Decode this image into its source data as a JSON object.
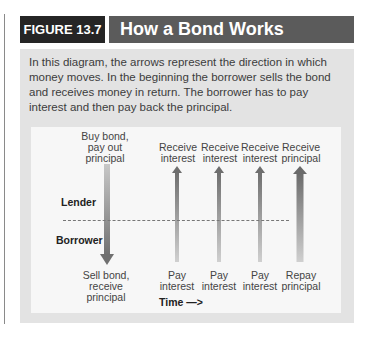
{
  "figure": {
    "tag": "FIGURE 13.7",
    "title": "How a Bond Works",
    "intro": "In this diagram, the arrows represent the direction in which money moves. In the beginning the borrower sells the bond and receives money in return. The borrower has to pay interest and then pay back the principal."
  },
  "diagram": {
    "roles": {
      "top": "Lender",
      "bottom": "Borrower"
    },
    "time_label": "Time —>",
    "columns": [
      {
        "top_label": [
          "Buy bond,",
          "pay out",
          "principal"
        ],
        "bottom_label": [
          "Sell bond,",
          "receive",
          "principal"
        ],
        "direction": "down",
        "width": "wide"
      },
      {
        "top_label": [
          "Receive",
          "interest"
        ],
        "bottom_label": [
          "Pay",
          "interest"
        ],
        "direction": "up",
        "width": "narrow"
      },
      {
        "top_label": [
          "Receive",
          "interest"
        ],
        "bottom_label": [
          "Pay",
          "interest"
        ],
        "direction": "up",
        "width": "narrow"
      },
      {
        "top_label": [
          "Receive",
          "interest"
        ],
        "bottom_label": [
          "Pay",
          "interest"
        ],
        "direction": "up",
        "width": "narrow"
      },
      {
        "top_label": [
          "Receive",
          "principal"
        ],
        "bottom_label": [
          "Repay",
          "principal"
        ],
        "direction": "up",
        "width": "wide"
      }
    ]
  },
  "colors": {
    "tag_bg": "#252525",
    "title_bg": "#5b5b5b",
    "panel_bg": "#e3e3e3",
    "diagram_bg": "#f7f7f7",
    "arrow": "#7a7a7a"
  }
}
